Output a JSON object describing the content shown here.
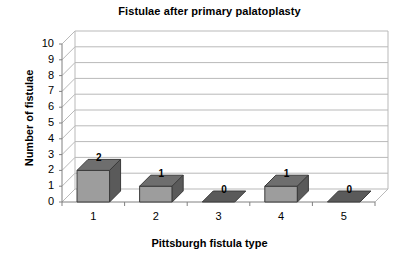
{
  "chart_data": {
    "type": "bar",
    "title": "Fistulae after primary palatoplasty",
    "xlabel": "Pittsburgh fistula type",
    "ylabel": "Number of fistulae",
    "categories": [
      "1",
      "2",
      "3",
      "4",
      "5"
    ],
    "values": [
      2,
      1,
      0,
      1,
      0
    ],
    "data_labels": [
      "2",
      "1",
      "0",
      "1",
      "0"
    ],
    "ylim": [
      0,
      10
    ],
    "ytick_labels": [
      "10",
      "9",
      "8",
      "7",
      "6",
      "5",
      "4",
      "3",
      "2",
      "1",
      "0"
    ],
    "ytick_values": [
      10,
      9,
      8,
      7,
      6,
      5,
      4,
      3,
      2,
      1,
      0
    ],
    "grid": true,
    "grid_axis": "y",
    "legend": "none",
    "style": "3d-column",
    "colors": {
      "bar_front": "#9d9d9d",
      "bar_side": "#5a5a5a",
      "bar_top": "#6e6e6e",
      "bar_edge": "#3b3b3b",
      "grid_line": "#b9b9b9",
      "axis_line": "#808080",
      "background": "#ffffff",
      "text": "#000000"
    }
  }
}
